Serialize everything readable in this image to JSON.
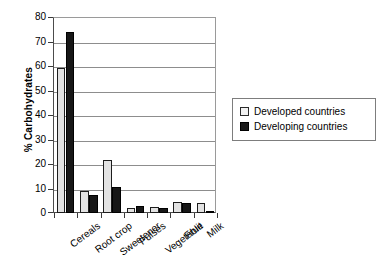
{
  "chart_data": {
    "type": "bar",
    "title": "",
    "xlabel": "",
    "ylabel": "% Carbohydrates",
    "ylim": [
      0,
      80
    ],
    "ytick_step": 10,
    "yticks": [
      "0",
      "10",
      "20",
      "30",
      "40",
      "50",
      "60",
      "70",
      "80"
    ],
    "grid": true,
    "legend_position": "right",
    "categories": [
      "Cereals",
      "Root crop",
      "Sweetener",
      "Pulses",
      "Vegetable",
      "Fruit",
      "Milk"
    ],
    "series": [
      {
        "name": "Developed countries",
        "color": "#e2e2e2",
        "values": [
          59,
          9,
          21.5,
          2,
          2.5,
          4.5,
          4
        ]
      },
      {
        "name": "Developing countries",
        "color": "#171717",
        "values": [
          74,
          7.5,
          10.5,
          3,
          2,
          4,
          1
        ]
      }
    ]
  },
  "legend": {
    "items": [
      {
        "label": "Developed countries",
        "swatch": "developed"
      },
      {
        "label": "Developing countries",
        "swatch": "developing"
      }
    ]
  }
}
